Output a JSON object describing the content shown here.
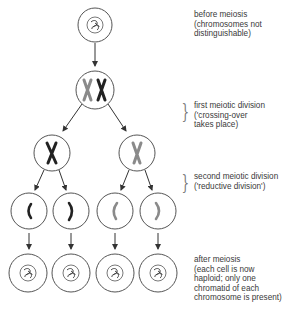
{
  "diagram": {
    "title": "Meiosis",
    "stages": [
      {
        "id": "before",
        "label": "before meiosis\n(chromosomes not\ndistinguishable)"
      },
      {
        "id": "first",
        "label": "first meiotic division\n('crossing-over\ntakes place)"
      },
      {
        "id": "second",
        "label": "second meiotic division\n('reductive division')"
      },
      {
        "id": "after",
        "label": "after meiosis\n(each cell is now\nhaploid; only one\nchromatid of each\nchromosome is present)"
      }
    ],
    "colors": {
      "outline": "#555555",
      "dark_chromosome": "#222222",
      "light_chromosome": "#8a8a8a",
      "arrow": "#333333"
    },
    "cells": [
      {
        "id": "c0",
        "content": "tangled-chromatin"
      },
      {
        "id": "c1",
        "content": "two-x-chromosomes"
      },
      {
        "id": "c2a",
        "content": "dark-x-chromosome"
      },
      {
        "id": "c2b",
        "content": "light-x-chromosome"
      },
      {
        "id": "c3a",
        "content": "dark-chromatid"
      },
      {
        "id": "c3b",
        "content": "dark-chromatid"
      },
      {
        "id": "c3c",
        "content": "light-chromatid"
      },
      {
        "id": "c3d",
        "content": "light-chromatid"
      },
      {
        "id": "c4a",
        "content": "tangled-chromatin"
      },
      {
        "id": "c4b",
        "content": "tangled-chromatin"
      },
      {
        "id": "c4c",
        "content": "tangled-chromatin"
      },
      {
        "id": "c4d",
        "content": "tangled-chromatin"
      }
    ]
  }
}
